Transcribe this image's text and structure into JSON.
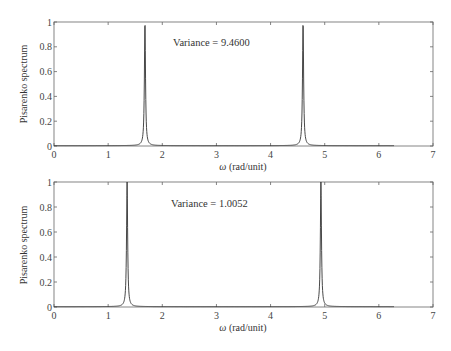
{
  "chart_data": [
    {
      "type": "line",
      "title": "",
      "xlabel": "ω (rad/unit)",
      "ylabel": "Pisarenko spectrum",
      "xlim": [
        0,
        7
      ],
      "ylim": [
        0,
        1
      ],
      "xticks": [
        0,
        1,
        2,
        3,
        4,
        5,
        6,
        7
      ],
      "yticks": [
        0,
        0.2,
        0.4,
        0.6,
        0.8,
        1
      ],
      "ytick_labels": [
        "0",
        "0.2",
        "0.4",
        "0.6",
        "0.8",
        "1"
      ],
      "grid": false,
      "annotation": "Variance = 9.4600",
      "x_range_of_curve": [
        0,
        6.28
      ],
      "peaks": [
        {
          "omega": 1.68,
          "value": 1.0
        },
        {
          "omega": 4.6,
          "value": 1.0
        }
      ],
      "baseline": 0.01,
      "series": [
        {
          "name": "Pisarenko spectrum",
          "description": "flat near 0 with two sharp unit peaks at ω≈1.68 and ω≈4.60"
        }
      ]
    },
    {
      "type": "line",
      "title": "",
      "xlabel": "ω (rad/unit)",
      "ylabel": "Pisarenko spectrum",
      "xlim": [
        0,
        7
      ],
      "ylim": [
        0,
        1
      ],
      "xticks": [
        0,
        1,
        2,
        3,
        4,
        5,
        6,
        7
      ],
      "yticks": [
        0,
        0.2,
        0.4,
        0.6,
        0.8,
        1
      ],
      "ytick_labels": [
        "0",
        "0.2",
        "0.4",
        "0.6",
        "0.8",
        "1"
      ],
      "grid": false,
      "annotation": "Variance = 1.0052",
      "x_range_of_curve": [
        0,
        6.28
      ],
      "peaks": [
        {
          "omega": 1.35,
          "value": 1.0
        },
        {
          "omega": 4.93,
          "value": 1.0
        }
      ],
      "baseline": 0.01,
      "series": [
        {
          "name": "Pisarenko spectrum",
          "description": "flat near 0 with two sharp unit peaks at ω≈1.35 and ω≈4.93"
        }
      ]
    }
  ],
  "plots": [
    {
      "annotation": "Variance = 9.4600",
      "xlabel_symbol": "ω",
      "xlabel_unit": " (rad/unit)",
      "ylabel": "Pisarenko spectrum"
    },
    {
      "annotation": "Variance = 1.0052",
      "xlabel_symbol": "ω",
      "xlabel_unit": " (rad/unit)",
      "ylabel": "Pisarenko spectrum"
    }
  ],
  "colors": {
    "axis": "#555555",
    "line": "#333333",
    "text": "#333333"
  }
}
